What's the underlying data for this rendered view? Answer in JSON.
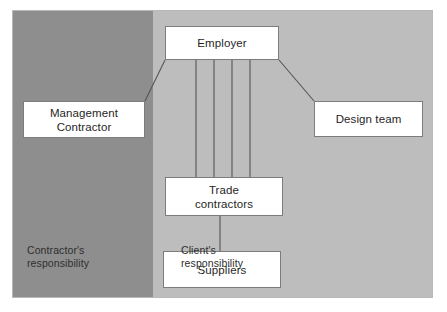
{
  "diagram": {
    "zones": [
      {
        "id": "contractor-zone",
        "caption": "Contractor's\nresponsibility",
        "color": "#8e8e8e"
      },
      {
        "id": "client-zone",
        "caption": "Client's\nresponsibility",
        "color": "#bdbdbd"
      }
    ],
    "nodes": [
      {
        "id": "employer",
        "label": "Employer"
      },
      {
        "id": "management",
        "label": "Management\nContractor"
      },
      {
        "id": "design",
        "label": "Design team"
      },
      {
        "id": "trade",
        "label": "Trade\ncontractors"
      },
      {
        "id": "suppliers",
        "label": "Suppliers"
      }
    ],
    "connections": [
      {
        "from": "employer",
        "to": "management",
        "style": "diagonal"
      },
      {
        "from": "employer",
        "to": "design",
        "style": "diagonal"
      },
      {
        "from": "employer",
        "to": "trade",
        "style": "vertical",
        "count": 4
      },
      {
        "from": "trade",
        "to": "suppliers",
        "style": "vertical",
        "count": 1
      }
    ],
    "colors": {
      "box_fill": "#ffffff",
      "box_border": "#7c7c7c",
      "line": "#555555",
      "frame_border": "#b9b9b9",
      "text": "#1f1f1f",
      "page_background": "#ffffff"
    }
  }
}
